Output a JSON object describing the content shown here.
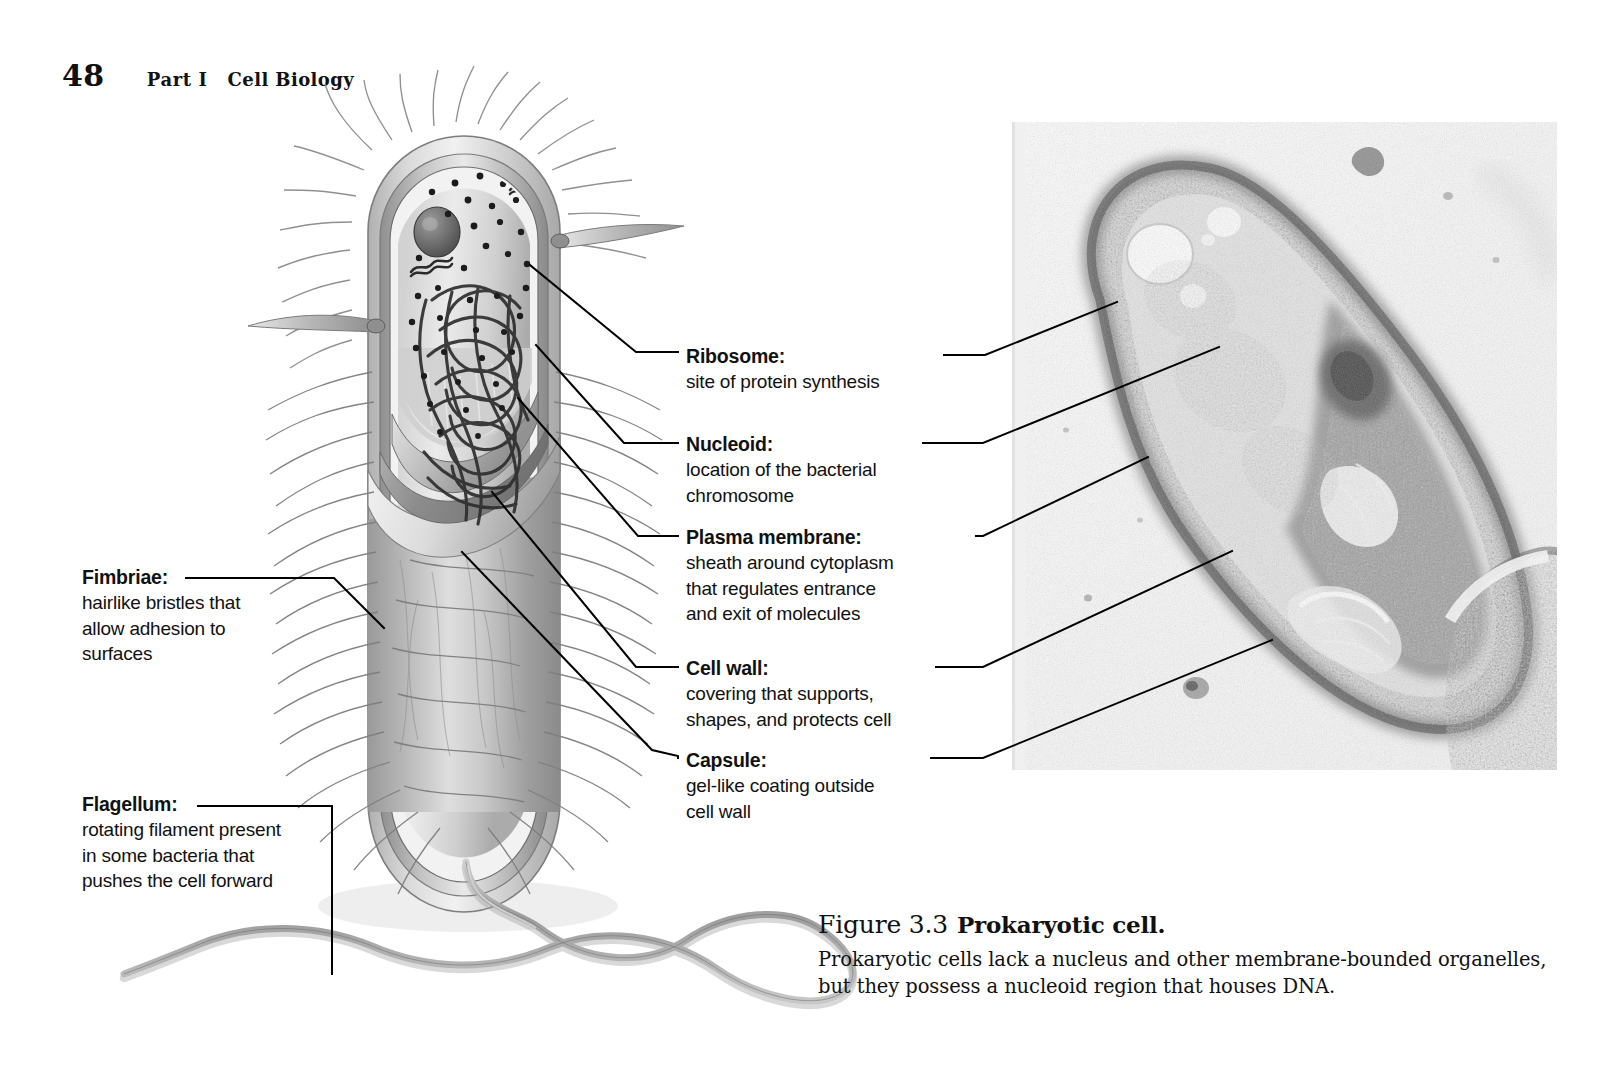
{
  "running_head": {
    "folio": "48",
    "part": "Part I",
    "title": "Cell Biology"
  },
  "labels": [
    {
      "id": "ribosome",
      "term": "Ribosome:",
      "description_lines": [
        "site of protein synthesis"
      ]
    },
    {
      "id": "nucleoid",
      "term": "Nucleoid:",
      "description_lines": [
        "location of the bacterial",
        "chromosome"
      ]
    },
    {
      "id": "plasma-membrane",
      "term": "Plasma membrane:",
      "description_lines": [
        "sheath around cytoplasm",
        "that regulates entrance",
        "and exit of molecules"
      ]
    },
    {
      "id": "cell-wall",
      "term": "Cell wall:",
      "description_lines": [
        "covering that supports,",
        "shapes, and protects cell"
      ]
    },
    {
      "id": "capsule",
      "term": "Capsule:",
      "description_lines": [
        "gel-like coating outside",
        "cell wall"
      ]
    },
    {
      "id": "fimbriae",
      "term": "Fimbriae:",
      "description_lines": [
        "hairlike bristles that",
        "allow adhesion to",
        "surfaces"
      ]
    },
    {
      "id": "flagellum",
      "term": "Flagellum:",
      "description_lines": [
        "rotating filament present",
        "in some bacteria that",
        "pushes the cell forward"
      ]
    }
  ],
  "caption": {
    "figure_number": "Figure 3.3",
    "figure_title": "Prokaryotic cell.",
    "body_lines": [
      "Prokaryotic cells lack a nucleus and other membrane-bounded organelles,",
      "but they possess a nucleoid region that houses DNA."
    ]
  },
  "illustration": {
    "name": "prokaryotic-cell-diagram",
    "structures": [
      "capsule",
      "cell-wall",
      "plasma-membrane",
      "cytoplasm",
      "nucleoid",
      "ribosomes",
      "plasmid",
      "fimbriae",
      "flagellum"
    ]
  },
  "micrograph": {
    "name": "tem-prokaryotic-cell-micrograph",
    "type": "transmission-electron-micrograph",
    "tone": "grayscale"
  },
  "colors": {
    "ink": "#111111",
    "leader_line": "#000000",
    "cell_light": "#e6e6e6",
    "cell_mid": "#b9b9b9",
    "cell_dark": "#8e8e8e",
    "micrograph_bg": "#f7f7f7",
    "micrograph_dark": "#6e6e6e"
  }
}
